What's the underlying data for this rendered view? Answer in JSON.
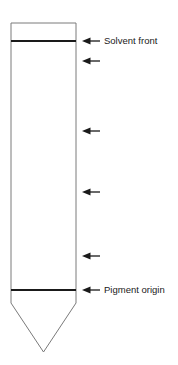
{
  "figure": {
    "type": "paper-chromatography-strip-diagram",
    "background_color": "#ffffff",
    "strip": {
      "outline_color": "#7a7a7a",
      "outline_width": 1,
      "left_x": 11,
      "right_x": 76,
      "top_y": 23,
      "body_bottom_y": 303,
      "tip_x": 43.5,
      "tip_y": 352
    },
    "bands": [
      {
        "name": "solvent-front-band",
        "y": 41,
        "color": "#1a1a1a",
        "thickness": 2.2,
        "label": "Solvent front",
        "labeled": true
      },
      {
        "name": "pigment-origin-band",
        "y": 290,
        "color": "#1a1a1a",
        "thickness": 2.2,
        "label": "Pigment origin",
        "labeled": true
      }
    ],
    "arrows": [
      {
        "name": "arrow-solvent-front",
        "y": 41,
        "label": "Solvent front"
      },
      {
        "name": "arrow-band-2",
        "y": 61,
        "label": ""
      },
      {
        "name": "arrow-band-3",
        "y": 131,
        "label": ""
      },
      {
        "name": "arrow-band-4",
        "y": 192,
        "label": ""
      },
      {
        "name": "arrow-band-5",
        "y": 256,
        "label": ""
      },
      {
        "name": "arrow-pigment-origin",
        "y": 290,
        "label": "Pigment origin"
      }
    ],
    "arrow_geometry": {
      "tip_x": 82,
      "tail_x": 100,
      "head_length": 8,
      "head_half_height": 3.6,
      "shaft_width": 1.3,
      "color": "#1a1a1a"
    },
    "labels": [
      {
        "name": "solvent-front-label",
        "text": "Solvent front",
        "x": 104,
        "y": 41
      },
      {
        "name": "pigment-origin-label",
        "text": "Pigment origin",
        "x": 104,
        "y": 290
      }
    ],
    "colors": {
      "ink": "#1a1a1a",
      "outline": "#7a7a7a",
      "background": "#ffffff"
    }
  }
}
